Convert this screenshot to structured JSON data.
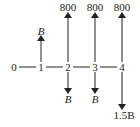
{
  "diagram": {
    "type": "cash-flow-diagram",
    "periods": [
      "0",
      "1",
      "2",
      "3",
      "4"
    ],
    "cash_flows": [
      {
        "period": "1",
        "direction": "up",
        "label": "B"
      },
      {
        "period": "2",
        "direction": "up",
        "label": "800"
      },
      {
        "period": "2",
        "direction": "down",
        "label": "B"
      },
      {
        "period": "3",
        "direction": "up",
        "label": "800"
      },
      {
        "period": "3",
        "direction": "down",
        "label": "B"
      },
      {
        "period": "4",
        "direction": "up",
        "label": "800"
      },
      {
        "period": "4",
        "direction": "down",
        "label": "1.5B"
      }
    ]
  }
}
